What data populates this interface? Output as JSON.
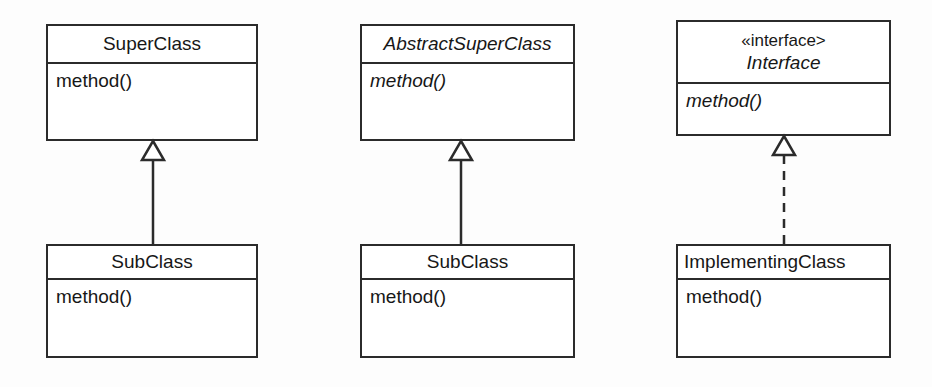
{
  "diagram": {
    "background_color": "#fdfdfd",
    "line_color": "#2b2b2b",
    "text_color": "#171717"
  },
  "groups": [
    {
      "id": "concrete-inheritance",
      "relationship": "generalization",
      "line_style": "solid",
      "arrow_head": "hollow-triangle",
      "parent": {
        "name": "SuperClass",
        "name_italic": false,
        "stereotype": null,
        "members": [
          {
            "label": "method()",
            "italic": false
          }
        ]
      },
      "child": {
        "name": "SubClass",
        "name_italic": false,
        "members": [
          {
            "label": "method()",
            "italic": false
          }
        ]
      }
    },
    {
      "id": "abstract-inheritance",
      "relationship": "generalization",
      "line_style": "solid",
      "arrow_head": "hollow-triangle",
      "parent": {
        "name": "AbstractSuperClass",
        "name_italic": true,
        "stereotype": null,
        "members": [
          {
            "label": "method()",
            "italic": true
          }
        ]
      },
      "child": {
        "name": "SubClass",
        "name_italic": false,
        "members": [
          {
            "label": "method()",
            "italic": false
          }
        ]
      }
    },
    {
      "id": "interface-realization",
      "relationship": "realization",
      "line_style": "dashed",
      "arrow_head": "hollow-triangle",
      "parent": {
        "name": "Interface",
        "name_italic": true,
        "stereotype": "«interface>",
        "members": [
          {
            "label": "method()",
            "italic": true
          }
        ]
      },
      "child": {
        "name": "ImplementingClass",
        "name_italic": false,
        "members": [
          {
            "label": "method()",
            "italic": false
          }
        ]
      }
    }
  ]
}
